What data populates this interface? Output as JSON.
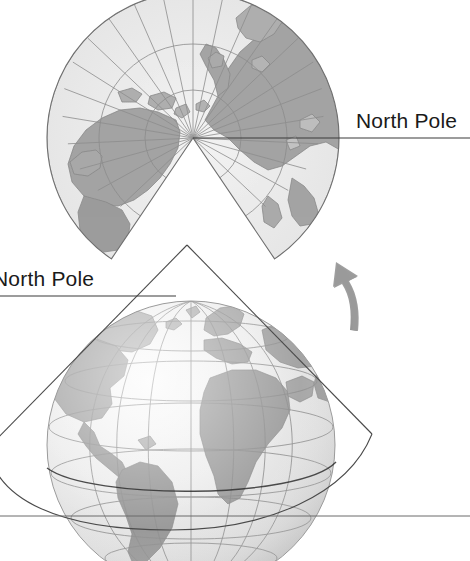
{
  "figure": {
    "background_color": "#ffffff"
  },
  "labels": {
    "top_north_pole": "North Pole",
    "bottom_north_pole": "North Pole"
  },
  "icons": {
    "rotation_arrow": "curved-up-left-arrow"
  },
  "colors": {
    "land": "#a9a9a9",
    "land_dark": "#949494",
    "ocean": "#e4e4e4",
    "ocean_light": "#efefef",
    "graticule": "#8d8d8d",
    "outline": "#6f6f6f",
    "arrow": "#9a9a9a",
    "leader_line": "#3a3a3a",
    "text": "#1a1a1a"
  },
  "projection_map": {
    "name": "unrolled-conic-fan",
    "apex": {
      "x": 193,
      "y": 138
    },
    "outer_radius": 146,
    "arc_radii": [
      48,
      94,
      146
    ],
    "meridian_count": 15,
    "gap_half_angle_deg": 34
  },
  "globe": {
    "name": "globe-with-cone",
    "center": {
      "x": 191,
      "y": 445
    },
    "radius": 144,
    "parallel_count": 6,
    "meridian_count": 7,
    "cone_apex": {
      "x": 187,
      "y": 245
    }
  },
  "horizon_line": {
    "y": 516,
    "x_start": 0,
    "x_end": 470
  },
  "leader_lines": {
    "top": {
      "y": 138,
      "x_start": 193,
      "x_end": 470
    },
    "bottom": {
      "y": 296,
      "x_start": 0,
      "x_end": 176
    }
  }
}
